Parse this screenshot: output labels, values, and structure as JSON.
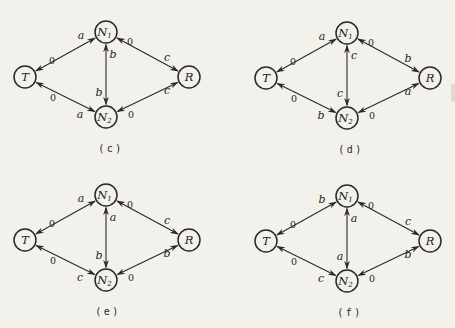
{
  "colors": {
    "paper": "#f3f1ec",
    "ink": "#2a2a28"
  },
  "diagrams": [
    {
      "id": "c",
      "caption": "(c)",
      "origin": {
        "x": 0,
        "y": 0
      },
      "nodes": [
        {
          "id": "T",
          "text": "T",
          "sub": "",
          "x": 25,
          "y": 77
        },
        {
          "id": "N1",
          "text": "N",
          "sub": "1",
          "x": 106,
          "y": 32
        },
        {
          "id": "N2",
          "text": "N",
          "sub": "2",
          "x": 106,
          "y": 117
        },
        {
          "id": "R",
          "text": "R",
          "sub": "",
          "x": 189,
          "y": 77
        }
      ],
      "edges": [
        {
          "from": "T",
          "to": "N1",
          "labels": [
            {
              "text": "0",
              "x": 52,
              "y": 60,
              "style": "plain"
            },
            {
              "text": "a",
              "x": 81,
              "y": 35,
              "style": "italic"
            }
          ]
        },
        {
          "from": "N1",
          "to": "R",
          "labels": [
            {
              "text": "0",
              "x": 130,
              "y": 41,
              "style": "plain"
            },
            {
              "text": "c",
              "x": 167,
              "y": 57,
              "style": "italic"
            }
          ]
        },
        {
          "from": "T",
          "to": "N2",
          "labels": [
            {
              "text": "0",
              "x": 53,
              "y": 97,
              "style": "plain"
            },
            {
              "text": "a",
              "x": 80,
              "y": 114,
              "style": "italic"
            }
          ]
        },
        {
          "from": "N2",
          "to": "R",
          "labels": [
            {
              "text": "0",
              "x": 131,
              "y": 114,
              "style": "plain"
            },
            {
              "text": "c",
              "x": 167,
              "y": 90,
              "style": "italic"
            }
          ]
        },
        {
          "from": "N1",
          "to": "N2",
          "labels": [
            {
              "text": "b",
              "x": 113,
              "y": 54,
              "style": "italic"
            },
            {
              "text": "b",
              "x": 99,
              "y": 92,
              "style": "italic"
            }
          ]
        }
      ]
    },
    {
      "id": "d",
      "caption": "(d)",
      "origin": {
        "x": 241,
        "y": 1
      },
      "nodes": [
        {
          "id": "T",
          "text": "T",
          "sub": "",
          "x": 25,
          "y": 77
        },
        {
          "id": "N1",
          "text": "N",
          "sub": "1",
          "x": 106,
          "y": 32
        },
        {
          "id": "N2",
          "text": "N",
          "sub": "2",
          "x": 106,
          "y": 117
        },
        {
          "id": "R",
          "text": "R",
          "sub": "",
          "x": 189,
          "y": 77
        }
      ],
      "edges": [
        {
          "from": "T",
          "to": "N1",
          "labels": [
            {
              "text": "0",
              "x": 52,
              "y": 60,
              "style": "plain"
            },
            {
              "text": "a",
              "x": 81,
              "y": 35,
              "style": "italic"
            }
          ]
        },
        {
          "from": "N1",
          "to": "R",
          "labels": [
            {
              "text": "0",
              "x": 130,
              "y": 41,
              "style": "plain"
            },
            {
              "text": "b",
              "x": 167,
              "y": 57,
              "style": "italic"
            }
          ]
        },
        {
          "from": "T",
          "to": "N2",
          "labels": [
            {
              "text": "0",
              "x": 53,
              "y": 97,
              "style": "plain"
            },
            {
              "text": "b",
              "x": 80,
              "y": 114,
              "style": "italic"
            }
          ]
        },
        {
          "from": "N2",
          "to": "R",
          "labels": [
            {
              "text": "0",
              "x": 131,
              "y": 114,
              "style": "plain"
            },
            {
              "text": "a",
              "x": 167,
              "y": 90,
              "style": "italic"
            }
          ]
        },
        {
          "from": "N1",
          "to": "N2",
          "labels": [
            {
              "text": "c",
              "x": 113,
              "y": 54,
              "style": "italic"
            },
            {
              "text": "c",
              "x": 99,
              "y": 92,
              "style": "italic"
            }
          ]
        }
      ]
    },
    {
      "id": "e",
      "caption": "(e)",
      "origin": {
        "x": 0,
        "y": 163
      },
      "nodes": [
        {
          "id": "T",
          "text": "T",
          "sub": "",
          "x": 25,
          "y": 77
        },
        {
          "id": "N1",
          "text": "N",
          "sub": "1",
          "x": 106,
          "y": 32
        },
        {
          "id": "N2",
          "text": "N",
          "sub": "2",
          "x": 106,
          "y": 117
        },
        {
          "id": "R",
          "text": "R",
          "sub": "",
          "x": 189,
          "y": 77
        }
      ],
      "edges": [
        {
          "from": "T",
          "to": "N1",
          "labels": [
            {
              "text": "0",
              "x": 52,
              "y": 60,
              "style": "plain"
            },
            {
              "text": "a",
              "x": 81,
              "y": 35,
              "style": "italic"
            }
          ]
        },
        {
          "from": "N1",
          "to": "R",
          "labels": [
            {
              "text": "0",
              "x": 130,
              "y": 41,
              "style": "plain"
            },
            {
              "text": "c",
              "x": 167,
              "y": 57,
              "style": "italic"
            }
          ]
        },
        {
          "from": "T",
          "to": "N2",
          "labels": [
            {
              "text": "0",
              "x": 53,
              "y": 97,
              "style": "plain"
            },
            {
              "text": "c",
              "x": 80,
              "y": 114,
              "style": "italic"
            }
          ]
        },
        {
          "from": "N2",
          "to": "R",
          "labels": [
            {
              "text": "0",
              "x": 131,
              "y": 114,
              "style": "plain"
            },
            {
              "text": "b",
              "x": 167,
              "y": 90,
              "style": "italic"
            }
          ]
        },
        {
          "from": "N1",
          "to": "N2",
          "labels": [
            {
              "text": "a",
              "x": 113,
              "y": 54,
              "style": "italic"
            },
            {
              "text": "b",
              "x": 99,
              "y": 92,
              "style": "italic"
            }
          ]
        }
      ]
    },
    {
      "id": "f",
      "caption": "(f)",
      "origin": {
        "x": 241,
        "y": 164
      },
      "nodes": [
        {
          "id": "T",
          "text": "T",
          "sub": "",
          "x": 25,
          "y": 77
        },
        {
          "id": "N1",
          "text": "N",
          "sub": "1",
          "x": 106,
          "y": 32
        },
        {
          "id": "N2",
          "text": "N",
          "sub": "2",
          "x": 106,
          "y": 117
        },
        {
          "id": "R",
          "text": "R",
          "sub": "",
          "x": 189,
          "y": 77
        }
      ],
      "edges": [
        {
          "from": "T",
          "to": "N1",
          "labels": [
            {
              "text": "0",
              "x": 52,
              "y": 60,
              "style": "plain"
            },
            {
              "text": "b",
              "x": 81,
              "y": 35,
              "style": "italic"
            }
          ]
        },
        {
          "from": "N1",
          "to": "R",
          "labels": [
            {
              "text": "0",
              "x": 130,
              "y": 41,
              "style": "plain"
            },
            {
              "text": "c",
              "x": 167,
              "y": 57,
              "style": "italic"
            }
          ]
        },
        {
          "from": "T",
          "to": "N2",
          "labels": [
            {
              "text": "0",
              "x": 53,
              "y": 97,
              "style": "plain"
            },
            {
              "text": "c",
              "x": 80,
              "y": 114,
              "style": "italic"
            }
          ]
        },
        {
          "from": "N2",
          "to": "R",
          "labels": [
            {
              "text": "0",
              "x": 131,
              "y": 114,
              "style": "plain"
            },
            {
              "text": "b",
              "x": 167,
              "y": 90,
              "style": "italic"
            }
          ]
        },
        {
          "from": "N1",
          "to": "N2",
          "labels": [
            {
              "text": "a",
              "x": 113,
              "y": 54,
              "style": "italic"
            },
            {
              "text": "a",
              "x": 99,
              "y": 92,
              "style": "italic"
            }
          ]
        }
      ]
    }
  ]
}
